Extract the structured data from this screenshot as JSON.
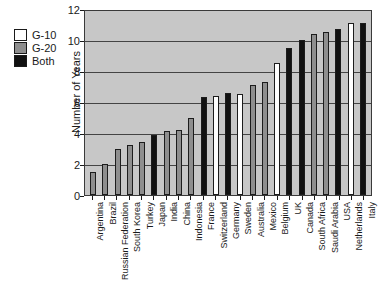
{
  "chart_data": {
    "type": "bar",
    "title": "",
    "xlabel": "",
    "ylabel": "Number of Years",
    "ylim": [
      0,
      12
    ],
    "yticks": [
      0,
      2,
      4,
      6,
      8,
      10,
      12
    ],
    "grid": true,
    "legend_position": "top-left",
    "legend": [
      {
        "label": "G-10",
        "key": "g10",
        "color": "#ffffff"
      },
      {
        "label": "G-20",
        "key": "g20",
        "color": "#8e8e8e"
      },
      {
        "label": "Both",
        "key": "both",
        "color": "#111111"
      }
    ],
    "categories": [
      "Argentina",
      "Brazil",
      "Russian Federation",
      "South Korea",
      "Turkey",
      "Japan",
      "India",
      "China",
      "Indonesia",
      "France",
      "Switzerland",
      "Germany",
      "Sweden",
      "Australia",
      "Mexico",
      "Belgium",
      "UK",
      "Canada",
      "South Africa",
      "Saudi Arabia",
      "USA",
      "Netherlands",
      "Italy"
    ],
    "values": [
      1.5,
      2.0,
      3.0,
      3.2,
      3.4,
      3.9,
      4.1,
      4.2,
      5.0,
      6.3,
      6.4,
      6.6,
      6.5,
      7.1,
      7.3,
      8.5,
      9.5,
      10.0,
      10.4,
      10.5,
      10.7,
      11.1,
      11.1
    ],
    "groups": [
      "g20",
      "g20",
      "g20",
      "g20",
      "g20",
      "both",
      "g20",
      "g20",
      "g20",
      "both",
      "g10",
      "both",
      "g10",
      "g20",
      "g20",
      "g10",
      "both",
      "both",
      "g20",
      "g20",
      "both",
      "g10",
      "both"
    ]
  }
}
